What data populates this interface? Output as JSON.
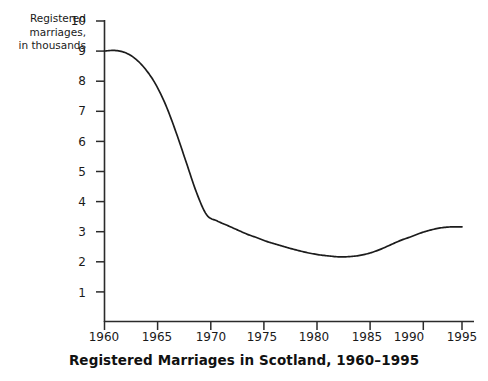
{
  "chart_data": {
    "type": "line",
    "title": "Registered Marriages in Scotland, 1960–1995",
    "xlabel": "",
    "ylabel": "Registered marriages, in thousands",
    "xlim": [
      1960,
      1995
    ],
    "ylim": [
      0,
      10
    ],
    "grid": false,
    "legend": null,
    "x_ticks": [
      "1960",
      "1965",
      "1970",
      "1975",
      "1980",
      "1985",
      "1990",
      "1995"
    ],
    "x_tick_values": [
      1960,
      1965,
      1970,
      1975,
      1980,
      1985,
      1990,
      1995
    ],
    "y_ticks": [
      "1",
      "2",
      "3",
      "4",
      "5",
      "6",
      "7",
      "8",
      "9",
      "10"
    ],
    "y_tick_values": [
      1,
      2,
      3,
      4,
      5,
      6,
      7,
      8,
      9,
      10
    ],
    "series": [
      {
        "name": "Registered marriages",
        "x": [
          1960,
          1961,
          1962,
          1963,
          1964,
          1965,
          1966,
          1967,
          1968,
          1969,
          1970,
          1971,
          1972,
          1973,
          1974,
          1975,
          1976,
          1977,
          1978,
          1979,
          1980,
          1981,
          1982,
          1983,
          1984,
          1985,
          1986,
          1987,
          1988,
          1989,
          1990,
          1991,
          1992,
          1993,
          1994,
          1995
        ],
        "values": [
          9.0,
          9.02,
          8.95,
          8.75,
          8.4,
          7.9,
          7.2,
          6.3,
          5.3,
          4.3,
          3.55,
          3.35,
          3.2,
          3.05,
          2.9,
          2.78,
          2.65,
          2.55,
          2.45,
          2.36,
          2.28,
          2.22,
          2.18,
          2.15,
          2.16,
          2.2,
          2.28,
          2.4,
          2.55,
          2.7,
          2.82,
          2.95,
          3.05,
          3.12,
          3.15,
          3.15
        ]
      }
    ]
  },
  "axis": {
    "y_caption_text": "Registered\nmarriages,\nin thousands"
  }
}
